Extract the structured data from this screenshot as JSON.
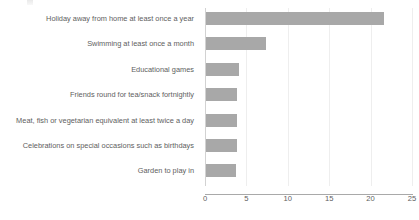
{
  "chart_data": {
    "type": "bar",
    "orientation": "horizontal",
    "title": "",
    "xlabel": "",
    "ylabel": "",
    "xlim": [
      0,
      25
    ],
    "xticks": [
      0,
      5,
      10,
      15,
      20,
      25
    ],
    "tick_labels": [
      "0",
      "5",
      "10",
      "15",
      "20",
      "25"
    ],
    "grid": true,
    "grid_axis": "x",
    "legend": false,
    "bar_color": "#a8a8a8",
    "axis_color": "#a9a9a9",
    "gridline_color": "#eeeeee",
    "text_color": "#5e5e5e",
    "categories": [
      "Holiday away from home at least once a year",
      "Swimming at least once a month",
      "Educational games",
      "Friends round for tea/snack fortnightly",
      "Meat, fish or vegetarian equivalent at least twice a day",
      "Celebrations on special occasions such as birthdays",
      "Garden to play in"
    ],
    "values": [
      21.5,
      7.2,
      4.0,
      3.7,
      3.7,
      3.7,
      3.6
    ]
  }
}
